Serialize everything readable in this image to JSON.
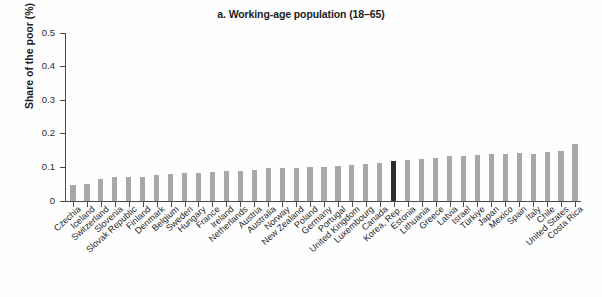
{
  "chart_data": {
    "type": "bar",
    "title": "a. Working-age population (18–65)",
    "xlabel": "",
    "ylabel": "Share of the poor (%)",
    "ylim": [
      0,
      0.5
    ],
    "ytick_labels": [
      "0",
      "0.1",
      "0.2",
      "0.3",
      "0.4",
      "0.5"
    ],
    "ytick_values": [
      0,
      0.1,
      0.2,
      0.3,
      0.4,
      0.5
    ],
    "grid": false,
    "legend": null,
    "bar_color": "#a8a8a8",
    "highlight_color": "#2c2c2c",
    "highlight_category": "Korea, Rep.",
    "categories": [
      "Czechia",
      "Iceland",
      "Switzerland",
      "Slovenia",
      "Slovak Republic",
      "Finland",
      "Denmark",
      "Belgium",
      "Sweden",
      "Hungary",
      "France",
      "Ireland",
      "Netherlands",
      "Austria",
      "Australia",
      "Norway",
      "New Zealand",
      "Poland",
      "Germany",
      "Portugal",
      "United Kingdom",
      "Luxembourg",
      "Canada",
      "Korea, Rep.",
      "Estonia",
      "Lithuania",
      "Greece",
      "Latvia",
      "Israel",
      "Türkiye",
      "Japan",
      "Mexico",
      "Spain",
      "Italy",
      "Chile",
      "United States",
      "Costa Rica"
    ],
    "values": [
      0.048,
      0.051,
      0.065,
      0.07,
      0.071,
      0.072,
      0.076,
      0.079,
      0.083,
      0.084,
      0.087,
      0.088,
      0.09,
      0.093,
      0.098,
      0.099,
      0.099,
      0.1,
      0.102,
      0.105,
      0.106,
      0.111,
      0.113,
      0.12,
      0.122,
      0.124,
      0.129,
      0.134,
      0.135,
      0.136,
      0.139,
      0.14,
      0.142,
      0.141,
      0.145,
      0.15,
      0.16
    ]
  },
  "notes": {
    "costa_rica_value": 0.17
  }
}
